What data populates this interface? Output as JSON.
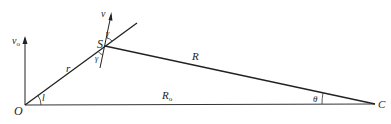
{
  "diagram": {
    "type": "geometry",
    "points": {
      "O": {
        "label": "O",
        "x": 25,
        "y": 105
      },
      "S": {
        "label": "S",
        "x": 105,
        "y": 47
      },
      "C": {
        "label": "C",
        "x": 375,
        "y": 103
      }
    },
    "segments": [
      {
        "name": "r",
        "from": "O",
        "to": "S",
        "label": "r"
      },
      {
        "name": "R",
        "from": "S",
        "to": "C",
        "label": "R"
      },
      {
        "name": "R0",
        "from": "O",
        "to": "C",
        "label": "R",
        "label_sub": "o"
      }
    ],
    "vectors": [
      {
        "name": "v0",
        "label": "v",
        "label_sub": "o"
      },
      {
        "name": "v",
        "label": "v"
      }
    ],
    "angles": [
      {
        "name": "l",
        "label": "l",
        "at": "O"
      },
      {
        "name": "gamma_top",
        "label": "γ",
        "at": "S"
      },
      {
        "name": "gamma_bottom",
        "label": "γ",
        "at": "S"
      },
      {
        "name": "theta",
        "label": "θ",
        "at": "C"
      }
    ],
    "colors": {
      "line": "#222222",
      "background": "#ffffff"
    }
  }
}
